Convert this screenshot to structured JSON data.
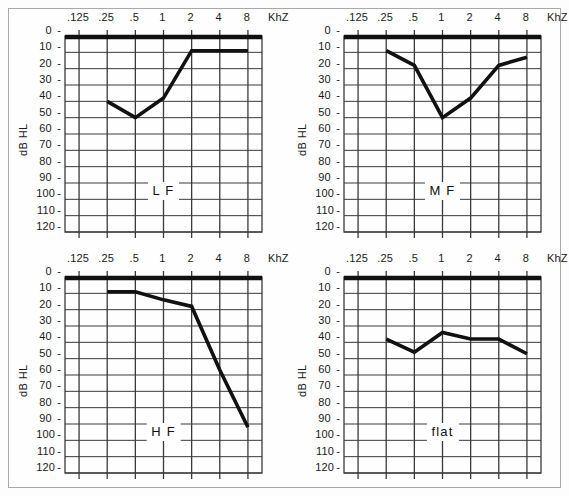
{
  "figure": {
    "axis": {
      "ylabel": "dB HL",
      "xunit": "KhZ",
      "xticks": [
        ".125",
        ".25",
        ".5",
        "1",
        "2",
        "4",
        "8"
      ],
      "yticks": [
        "0",
        "10",
        "20",
        "30",
        "40",
        "50",
        "60",
        "70",
        "80",
        "90",
        "100",
        "110",
        "120"
      ]
    },
    "colors": {
      "curve": "#111111",
      "reference_line": "#111111",
      "grid": "#3a3a3a",
      "frame": "#a9a9a9",
      "background": "#fefefe",
      "text": "#1a1a1a"
    }
  },
  "chart_data": [
    {
      "type": "line",
      "title": "L F",
      "panel": "top-left",
      "xlabel": "KhZ",
      "ylabel": "dB HL",
      "categories": [
        ".125",
        ".25",
        ".5",
        "1",
        "2",
        "4",
        "8"
      ],
      "x": [
        0.125,
        0.25,
        0.5,
        1,
        2,
        4,
        8
      ],
      "values": [
        null,
        40,
        50,
        38,
        9,
        9,
        9
      ],
      "reference_line_db": 0,
      "ylim": [
        0,
        120
      ],
      "y_inverted": true,
      "grid": true,
      "legend": "none",
      "annotation": "L F"
    },
    {
      "type": "line",
      "title": "M F",
      "panel": "top-right",
      "xlabel": "KhZ",
      "ylabel": "dB HL",
      "categories": [
        ".125",
        ".25",
        ".5",
        "1",
        "2",
        "4",
        "8"
      ],
      "x": [
        0.125,
        0.25,
        0.5,
        1,
        2,
        4,
        8
      ],
      "values": [
        null,
        9,
        18,
        50,
        38,
        18,
        13
      ],
      "reference_line_db": 0,
      "ylim": [
        0,
        120
      ],
      "y_inverted": true,
      "grid": true,
      "legend": "none",
      "annotation": "M F"
    },
    {
      "type": "line",
      "title": "H F",
      "panel": "bottom-left",
      "xlabel": "KhZ",
      "ylabel": "dB HL",
      "categories": [
        ".125",
        ".25",
        ".5",
        "1",
        "2",
        "4",
        "8"
      ],
      "x": [
        0.125,
        0.25,
        0.5,
        1,
        2,
        4,
        8
      ],
      "values": [
        null,
        9,
        9,
        14,
        18,
        57,
        92
      ],
      "reference_line_db": 0,
      "ylim": [
        0,
        120
      ],
      "y_inverted": true,
      "grid": true,
      "legend": "none",
      "annotation": "H F"
    },
    {
      "type": "line",
      "title": "flat",
      "panel": "bottom-right",
      "xlabel": "KhZ",
      "ylabel": "dB HL",
      "categories": [
        ".125",
        ".25",
        ".5",
        "1",
        "2",
        "4",
        "8"
      ],
      "x": [
        0.125,
        0.25,
        0.5,
        1,
        2,
        4,
        8
      ],
      "values": [
        null,
        38,
        46,
        34,
        38,
        38,
        47
      ],
      "reference_line_db": 0,
      "ylim": [
        0,
        120
      ],
      "y_inverted": true,
      "grid": true,
      "legend": "none",
      "annotation": "flat"
    }
  ]
}
